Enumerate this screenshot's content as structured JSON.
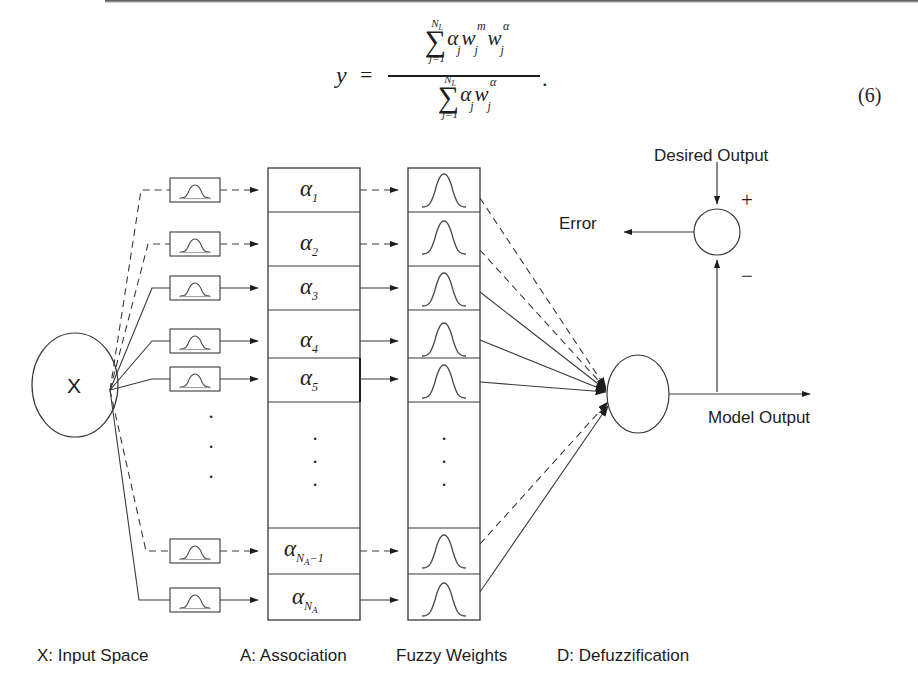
{
  "page": {
    "equation": {
      "lhs": "y",
      "equals": "=",
      "sigma": "∑",
      "numerator_upper_limit": "N",
      "numerator_upper_limit_sub": "L",
      "numerator_lower_limit": "j=1",
      "numerator_terms": "α w w",
      "denominator_upper_limit": "N",
      "denominator_upper_limit_sub": "L",
      "denominator_lower_limit": "j=1",
      "trailing_period": ".",
      "number": "(6)",
      "plain_text": "y = ( sum_{j=1}^{N_L} alpha_j w_j^m w_j^alpha ) / ( sum_{j=1}^{N_L} alpha_j w_j^alpha )."
    },
    "diagram": {
      "input_node_label": "X",
      "association_rows": [
        {
          "label": "α",
          "sub": "1",
          "style": "dashed"
        },
        {
          "label": "α",
          "sub": "2",
          "style": "dashed"
        },
        {
          "label": "α",
          "sub": "3",
          "style": "solid"
        },
        {
          "label": "α",
          "sub": "4",
          "style": "solid"
        },
        {
          "label": "α",
          "sub": "5",
          "style": "solid"
        },
        {
          "label": "α",
          "sub": "N_A-1",
          "style": "dashed"
        },
        {
          "label": "α",
          "sub": "N_A",
          "style": "solid"
        }
      ],
      "vertical_ellipsis": "·",
      "membership_function_icon": "gaussian-bell-curve",
      "fuzzy_weight_icon": "gaussian-bell-curve",
      "summing_junction": {
        "plus_sign": "+",
        "minus_sign": "−"
      },
      "annotations": {
        "desired_output": "Desired Output",
        "error": "Error",
        "model_output": "Model Output"
      },
      "captions": [
        "X: Input Space",
        "A: Association",
        "Fuzzy Weights",
        "D: Defuzzification"
      ]
    },
    "colors": {
      "ink": "#1d1d1d",
      "line": "#3a3a3a",
      "paper": "#ffffff"
    }
  }
}
